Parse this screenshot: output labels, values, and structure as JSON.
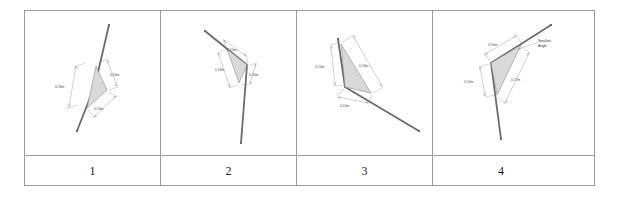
{
  "figure": {
    "type": "table",
    "columns": 4,
    "column_labels": [
      "1",
      "2",
      "3",
      "4"
    ],
    "fill_color": "#d9d9d9",
    "line_color": "#6b6b6b",
    "border_color": "#9b9b9b",
    "dimension_text_color": "#4a4a4a"
  },
  "panels": [
    {
      "id": "panel-1",
      "label": "1",
      "dimensions": [
        {
          "name": "dim-left",
          "text": "0.18m"
        },
        {
          "name": "dim-right",
          "text": "0.10m"
        },
        {
          "name": "dim-bottom",
          "text": "0.10m"
        }
      ],
      "annotations": []
    },
    {
      "id": "panel-2",
      "label": "2",
      "dimensions": [
        {
          "name": "dim-top",
          "text": "0.10m"
        },
        {
          "name": "dim-left",
          "text": "0.18m"
        },
        {
          "name": "dim-right",
          "text": "0.10m"
        }
      ],
      "annotations": []
    },
    {
      "id": "panel-3",
      "label": "3",
      "dimensions": [
        {
          "name": "dim-left",
          "text": "0.10m"
        },
        {
          "name": "dim-right",
          "text": "0.18m"
        },
        {
          "name": "dim-bottom",
          "text": "0.10m"
        }
      ],
      "annotations": []
    },
    {
      "id": "panel-4",
      "label": "4",
      "dimensions": [
        {
          "name": "dim-top",
          "text": "0.10m"
        },
        {
          "name": "dim-left",
          "text": "0.10m"
        },
        {
          "name": "dim-right",
          "text": "0.17m"
        }
      ],
      "annotations": [
        {
          "name": "smallest-angle-line1",
          "text": "Smallest"
        },
        {
          "name": "smallest-angle-line2",
          "text": "Angle"
        }
      ]
    }
  ]
}
